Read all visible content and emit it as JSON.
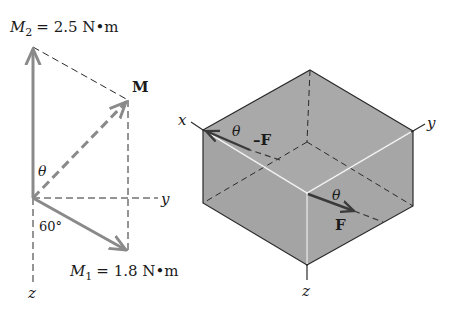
{
  "colors": {
    "vector": "#8a8a8a",
    "line": "#2a2a2a",
    "box_fill": "#a9a9a9",
    "box_highlight": "#f2f2f2",
    "background": "#ffffff"
  },
  "left_diagram": {
    "m2_label": {
      "symbol": "M",
      "subscript": "2",
      "value": "= 2.5 N•m"
    },
    "m_label": "M",
    "m1_label": {
      "symbol": "M",
      "subscript": "1",
      "value": "= 1.8 N•m"
    },
    "theta_label": "θ",
    "angle_label": "60°",
    "y_axis_label": "y",
    "z_axis_label": "z"
  },
  "right_diagram": {
    "x_axis_label": "x",
    "y_axis_label": "y",
    "z_axis_label": "z",
    "neg_force_label": "–F",
    "force_label": "F",
    "theta_top_label": "θ",
    "theta_front_label": "θ"
  }
}
